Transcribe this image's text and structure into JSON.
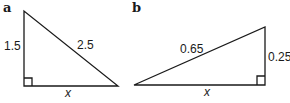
{
  "figure": {
    "triangle_a": {
      "label": "a",
      "vertical_side": "1.5",
      "hypotenuse": "2.5",
      "base": "x"
    },
    "triangle_b": {
      "label": "b",
      "hypotenuse": "0.65",
      "vertical_side": "0.25",
      "base": "x"
    }
  }
}
